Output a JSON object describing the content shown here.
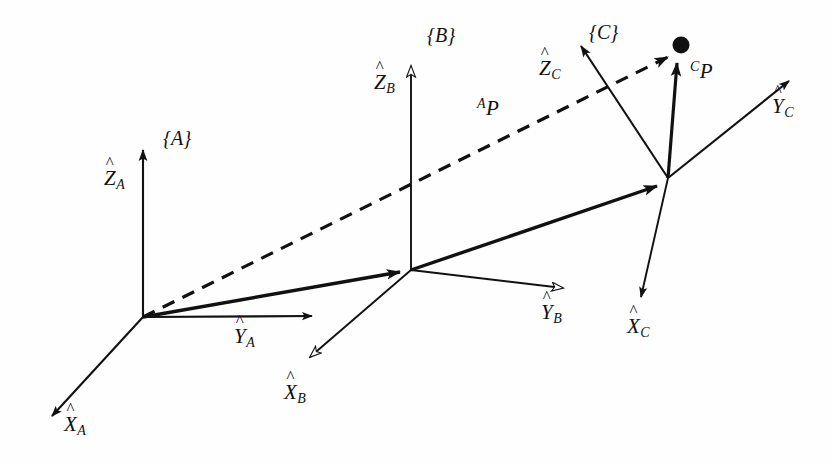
{
  "figure": {
    "background_color": "#fefefe",
    "stroke_color": "#111111",
    "width": 832,
    "height": 464
  },
  "frames": [
    {
      "id": "A",
      "frame_label": "{A}",
      "origin": [
        143,
        317
      ],
      "axes": [
        {
          "name": "z",
          "label_base": "Z",
          "label_sub": "A",
          "hat": "^",
          "tip": [
            143,
            143
          ],
          "arrow_style": "filled"
        },
        {
          "name": "y",
          "label_base": "Y",
          "label_sub": "A",
          "hat": "^",
          "tip": [
            318,
            316
          ],
          "arrow_style": "filled"
        },
        {
          "name": "x",
          "label_base": "X",
          "label_sub": "A",
          "hat": "^",
          "tip": [
            45,
            422
          ],
          "arrow_style": "filled"
        }
      ]
    },
    {
      "id": "B",
      "frame_label": "{B}",
      "origin": [
        411,
        270
      ],
      "axes": [
        {
          "name": "z",
          "label_base": "Z",
          "label_sub": "B",
          "hat": "^",
          "tip": [
            411,
            58
          ],
          "arrow_style": "hollow"
        },
        {
          "name": "y",
          "label_base": "Y",
          "label_sub": "B",
          "hat": "^",
          "tip": [
            570,
            290
          ],
          "arrow_style": "hollow"
        },
        {
          "name": "x",
          "label_base": "X",
          "label_sub": "B",
          "hat": "^",
          "tip": [
            303,
            365
          ],
          "arrow_style": "hollow"
        }
      ]
    },
    {
      "id": "C",
      "frame_label": "{C}",
      "origin": [
        668,
        178
      ],
      "axes": [
        {
          "name": "z",
          "label_base": "Z",
          "label_sub": "C",
          "hat": "^",
          "tip": [
            574,
            37
          ],
          "arrow_style": "filled"
        },
        {
          "name": "y",
          "label_base": "Y",
          "label_sub": "C",
          "hat": "^",
          "tip": [
            795,
            75
          ],
          "arrow_style": "filled"
        },
        {
          "name": "x",
          "label_base": "X",
          "label_sub": "C",
          "hat": "^",
          "tip": [
            642,
            305
          ],
          "arrow_style": "filled"
        }
      ]
    }
  ],
  "labels": {
    "frame_a": "{A}",
    "frame_b": "{B}",
    "frame_c": "{C}",
    "z_a_base": "Z",
    "z_a_sub": "A",
    "y_a_base": "Y",
    "y_a_sub": "A",
    "x_a_base": "X",
    "x_a_sub": "A",
    "z_b_base": "Z",
    "z_b_sub": "B",
    "y_b_base": "Y",
    "y_b_sub": "B",
    "x_b_base": "X",
    "x_b_sub": "B",
    "z_c_base": "Z",
    "z_c_sub": "C",
    "y_c_base": "Y",
    "y_c_sub": "C",
    "x_c_base": "X",
    "x_c_sub": "C",
    "hat": "^",
    "ap_sup": "A",
    "ap_base": "P",
    "cp_sup": "C",
    "cp_base": "P"
  },
  "vectors": [
    {
      "name": "A-to-B-origin",
      "from": [
        143,
        317
      ],
      "to": [
        411,
        270
      ],
      "style": "thick-solid",
      "label": null
    },
    {
      "name": "B-to-C-origin",
      "from": [
        411,
        270
      ],
      "to": [
        668,
        178
      ],
      "style": "thick-solid",
      "label": null
    },
    {
      "name": "A-to-point-P",
      "from": [
        143,
        317
      ],
      "to": [
        678,
        52
      ],
      "style": "thick-dashed",
      "label": "AP"
    },
    {
      "name": "C-to-point-P",
      "from": [
        668,
        178
      ],
      "to": [
        678,
        58
      ],
      "style": "thick-solid",
      "label": "CP"
    }
  ],
  "point": {
    "name": "P",
    "position": [
      681,
      45
    ],
    "radius": 8,
    "color": "#111111"
  }
}
